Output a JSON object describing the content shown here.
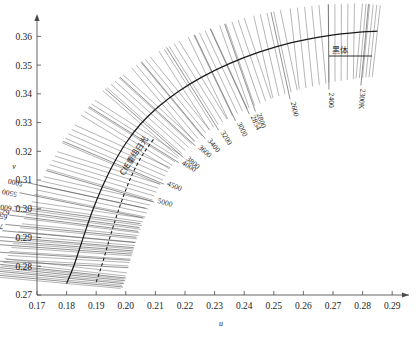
{
  "chart_data": {
    "type": "line",
    "title": "",
    "xlabel": "u",
    "ylabel": "v",
    "xlim": [
      0.17,
      0.295
    ],
    "ylim": [
      0.27,
      0.365
    ],
    "grid": false,
    "legend_position": "none",
    "xticks": [
      "0.17",
      "0.18",
      "0.19",
      "0.20",
      "0.21",
      "0.22",
      "0.23",
      "0.24",
      "0.25",
      "0.26",
      "0.27",
      "0.28",
      "0.29"
    ],
    "xtick_values": [
      0.17,
      0.18,
      0.19,
      0.2,
      0.21,
      0.22,
      0.23,
      0.24,
      0.25,
      0.26,
      0.27,
      0.28,
      0.29
    ],
    "yticks": [
      "0.27",
      "0.28",
      "0.29",
      "0.30",
      "0.31",
      "0.32",
      "0.33",
      "0.34",
      "0.35",
      "0.36"
    ],
    "ytick_values": [
      0.27,
      0.28,
      0.29,
      0.3,
      0.31,
      0.32,
      0.33,
      0.34,
      0.35,
      0.36
    ],
    "series": [
      {
        "name": "黑体",
        "style": "solid",
        "points": [
          [
            0.18,
            0.274
          ],
          [
            0.1824,
            0.28
          ],
          [
            0.1845,
            0.2865
          ],
          [
            0.1866,
            0.293
          ],
          [
            0.189,
            0.3
          ],
          [
            0.192,
            0.3075
          ],
          [
            0.1955,
            0.315
          ],
          [
            0.2,
            0.3228
          ],
          [
            0.205,
            0.3295
          ],
          [
            0.211,
            0.3355
          ],
          [
            0.218,
            0.341
          ],
          [
            0.226,
            0.346
          ],
          [
            0.235,
            0.3505
          ],
          [
            0.245,
            0.3545
          ],
          [
            0.256,
            0.3578
          ],
          [
            0.268,
            0.3602
          ],
          [
            0.279,
            0.3615
          ],
          [
            0.285,
            0.3618
          ]
        ]
      },
      {
        "name": "CIE重组日光",
        "style": "dashed",
        "points": [
          [
            0.19,
            0.2745
          ],
          [
            0.1918,
            0.28
          ],
          [
            0.1935,
            0.286
          ],
          [
            0.1952,
            0.292
          ],
          [
            0.1972,
            0.2985
          ],
          [
            0.1996,
            0.3055
          ],
          [
            0.2024,
            0.3125
          ],
          [
            0.2058,
            0.319
          ],
          [
            0.2096,
            0.3245
          ]
        ]
      }
    ],
    "isotherm_labels_left": [
      {
        "label": "5000",
        "boxed": false
      },
      {
        "label": "5500",
        "boxed": false
      },
      {
        "label": "6000",
        "boxed": false
      },
      {
        "label": "6250",
        "boxed": false
      },
      {
        "label": "6500",
        "boxed": false
      },
      {
        "label": "7000",
        "boxed": false
      },
      {
        "label": "7500",
        "boxed": false
      },
      {
        "label": "8000",
        "boxed": false
      },
      {
        "label": "8500",
        "boxed": false
      },
      {
        "label": "9000",
        "boxed": false
      },
      {
        "label": "10000",
        "boxed": false
      },
      {
        "label": "12000",
        "boxed": true
      },
      {
        "label": "15000",
        "boxed": true
      },
      {
        "label": "17000",
        "boxed": true
      },
      {
        "label": "20000",
        "boxed": true
      },
      {
        "label": "25000",
        "boxed": true
      }
    ],
    "isotherm_labels_right": [
      {
        "label": "5000"
      },
      {
        "label": "4500"
      },
      {
        "label": "4000"
      },
      {
        "label": "3800"
      },
      {
        "label": "3600"
      },
      {
        "label": "3400"
      },
      {
        "label": "3200"
      },
      {
        "label": "3000"
      },
      {
        "label": "2854"
      },
      {
        "label": "2800"
      },
      {
        "label": "2600"
      },
      {
        "label": "2400"
      },
      {
        "label": "2300K"
      }
    ],
    "annotations": [
      {
        "text": "黑体",
        "meaning": "blackbody-locus-label"
      },
      {
        "text": "CIE重组日光",
        "meaning": "cie-reconstituted-daylight-label"
      }
    ]
  },
  "axes": {
    "x_axis_name": "u",
    "y_axis_name": "v"
  },
  "caption": {
    "text": ""
  },
  "colors": {
    "isoline": "#6d6d6d",
    "curve": "#1a1a1a",
    "axis": "#4a4a4a",
    "text": "#1d1d1d",
    "background": "#ffffff"
  }
}
